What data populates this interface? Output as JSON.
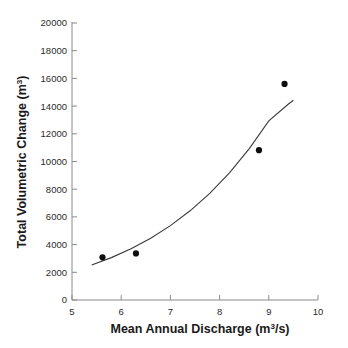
{
  "chart_data": {
    "type": "scatter",
    "title": "",
    "xlabel": "Mean Annual Discharge (m3/s)",
    "xlabel_base": "Mean Annual Discharge (m",
    "xlabel_sup": "3",
    "xlabel_tail": "/s)",
    "ylabel": "Total Volumetric Change (m3)",
    "ylabel_base": "Total Volumetric Change (m",
    "ylabel_sup": "3",
    "ylabel_tail": ")",
    "xlim": [
      5,
      10
    ],
    "ylim": [
      0,
      20000
    ],
    "xticks": [
      5,
      6,
      7,
      8,
      9,
      10
    ],
    "yticks": [
      0,
      2000,
      4000,
      6000,
      8000,
      10000,
      12000,
      14000,
      16000,
      18000,
      20000
    ],
    "xticklabels": [
      "5",
      "6",
      "7",
      "8",
      "9",
      "10"
    ],
    "yticklabels": [
      "0",
      "2000",
      "4000",
      "6000",
      "8000",
      "10000",
      "12000",
      "14000",
      "16000",
      "18000",
      "20000"
    ],
    "grid": false,
    "legend": null,
    "marker": "filled-circle",
    "marker_color": "#0d0d0d",
    "curve_color": "#3a3a3a",
    "axis_color": "#8a8a8a",
    "points": [
      {
        "x": 5.62,
        "y": 3080
      },
      {
        "x": 6.3,
        "y": 3360
      },
      {
        "x": 8.8,
        "y": 10820
      },
      {
        "x": 9.32,
        "y": 15600
      }
    ],
    "series": [
      {
        "name": "Observed sites",
        "x": [
          5.62,
          6.3,
          8.8,
          9.32
        ],
        "values": [
          3080,
          3360,
          10820,
          15600
        ]
      },
      {
        "name": "Exponential fit",
        "type": "line",
        "x": [
          5.4,
          5.8,
          6.2,
          6.6,
          7.0,
          7.4,
          7.8,
          8.2,
          8.6,
          9.0,
          9.4,
          9.5
        ],
        "values": [
          2530,
          3060,
          3700,
          4460,
          5370,
          6440,
          7700,
          9180,
          10910,
          12930,
          14150,
          14420
        ]
      }
    ],
    "annotations": []
  },
  "caption": {
    "partial_text": ""
  }
}
